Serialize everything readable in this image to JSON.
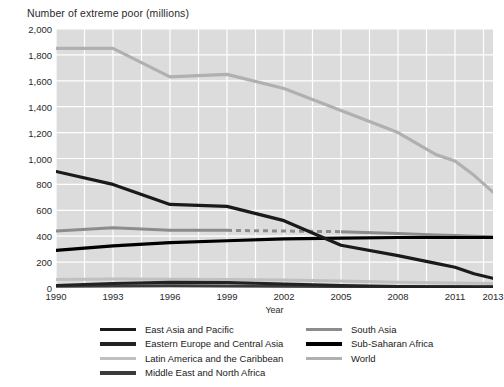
{
  "chart_data": {
    "type": "line",
    "title": "Number of extreme poor (millions)",
    "xlabel": "Year",
    "ylabel": "",
    "xlim": [
      1990,
      2013
    ],
    "ylim": [
      0,
      2000
    ],
    "grid": true,
    "legend_position": "bottom",
    "xticks": [
      "1990",
      "1993",
      "1996",
      "1999",
      "2002",
      "2005",
      "2008",
      "2011",
      "2013"
    ],
    "xtick_values": [
      1990,
      1993,
      1996,
      1999,
      2002,
      2005,
      2008,
      2011,
      2013
    ],
    "yticks": [
      "0",
      "200",
      "400",
      "600",
      "800",
      "1,000",
      "1,200",
      "1,400",
      "1,600",
      "1,800",
      "2,000"
    ],
    "ytick_values": [
      0,
      200,
      400,
      600,
      800,
      1000,
      1200,
      1400,
      1600,
      1800,
      2000
    ],
    "x": [
      1990,
      1993,
      1996,
      1999,
      2002,
      2005,
      2008,
      2010,
      2011,
      2012,
      2013
    ],
    "series": [
      {
        "name": "World",
        "color": "#b0b0b0",
        "width": 3.2,
        "dash": "none",
        "values": [
          1850,
          1850,
          1630,
          1650,
          1540,
          1370,
          1200,
          1030,
          980,
          870,
          740
        ]
      },
      {
        "name": "East Asia and Pacific",
        "color": "#1a1a1a",
        "width": 3.2,
        "dash": "none",
        "values": [
          900,
          800,
          645,
          630,
          520,
          330,
          250,
          190,
          160,
          110,
          75
        ]
      },
      {
        "name": "South Asia",
        "color": "#8c8c8c",
        "width": 3.0,
        "dash": "segmented",
        "values": [
          440,
          465,
          445,
          445,
          440,
          435,
          420,
          410,
          405,
          400,
          395
        ]
      },
      {
        "name": "Sub-Saharan Africa",
        "color": "#000000",
        "width": 3.2,
        "dash": "none",
        "values": [
          290,
          325,
          350,
          365,
          380,
          385,
          390,
          390,
          390,
          390,
          390
        ]
      },
      {
        "name": "Latin America and the Caribbean",
        "color": "#c0c0c0",
        "width": 3.0,
        "dash": "none",
        "values": [
          65,
          70,
          68,
          66,
          62,
          55,
          45,
          40,
          38,
          36,
          34
        ]
      },
      {
        "name": "Eastern Europe and Central Asia",
        "color": "#222222",
        "width": 3.0,
        "dash": "none",
        "values": [
          20,
          35,
          45,
          42,
          30,
          20,
          12,
          10,
          9,
          8,
          8
        ]
      },
      {
        "name": "Middle East and North Africa",
        "color": "#3a3a3a",
        "width": 3.0,
        "dash": "none",
        "values": [
          14,
          16,
          17,
          16,
          14,
          12,
          10,
          10,
          10,
          10,
          10
        ]
      }
    ]
  },
  "legend": {
    "left_items": [
      {
        "label": "East Asia and Pacific",
        "color": "#1a1a1a"
      },
      {
        "label": "Eastern Europe and Central Asia",
        "color": "#222222"
      },
      {
        "label": "Latin America and the Caribbean",
        "color": "#c0c0c0"
      },
      {
        "label": "Middle East and North Africa",
        "color": "#3a3a3a"
      }
    ],
    "right_items": [
      {
        "label": "South Asia",
        "color": "#8c8c8c"
      },
      {
        "label": "Sub-Saharan Africa",
        "color": "#000000"
      },
      {
        "label": "World",
        "color": "#b0b0b0"
      }
    ]
  },
  "style": {
    "plot_background": "#dcdcdc",
    "gridline_color": "#ffffff",
    "page_background": "#ffffff",
    "text_color": "#2a2a2a"
  }
}
